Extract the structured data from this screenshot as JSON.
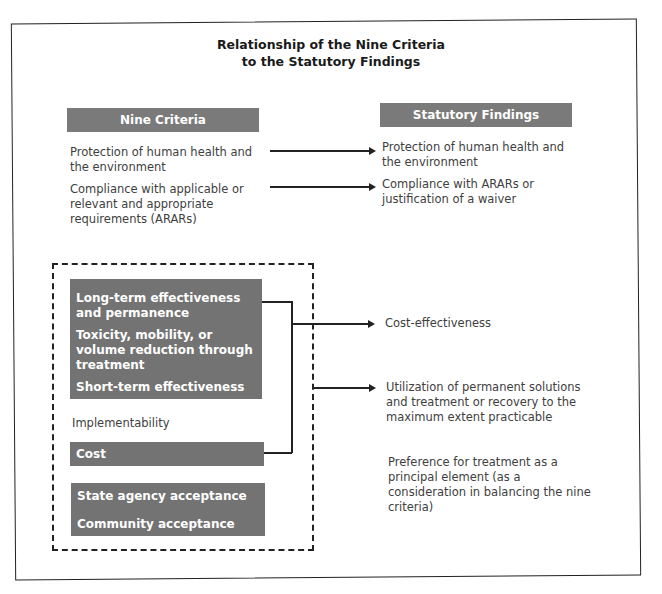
{
  "title": {
    "line1": "Relationship of the Nine Criteria",
    "line2": "to the Statutory Findings"
  },
  "left_header": "Nine Criteria",
  "right_header": "Statutory Findings",
  "criteria_threshold": [
    {
      "text": "Protection of human health and the environment"
    },
    {
      "text": "Compliance with applicable or relevant and appropriate requirements (ARARs)"
    }
  ],
  "findings_threshold": [
    {
      "text": "Protection of human health and the environment"
    },
    {
      "text": "Compliance with ARARs or justification of a waiver"
    }
  ],
  "balancing_group": [
    {
      "text": "Long-term effectiveness and permanence"
    },
    {
      "text": "Toxicity, mobility, or volume reduction through treatment"
    },
    {
      "text": "Short-term effectiveness"
    }
  ],
  "implementability": "Implementability",
  "cost": "Cost",
  "modifying_group": [
    {
      "text": "State agency acceptance"
    },
    {
      "text": "Community acceptance"
    }
  ],
  "findings_balancing": [
    {
      "text": "Cost-effectiveness"
    },
    {
      "text": "Utilization of permanent solutions and treatment or recovery to the maximum extent practicable"
    },
    {
      "text": "Preference for treatment as a principal element (as a consideration in balancing the nine criteria)"
    }
  ],
  "colors": {
    "header_gray": "#7a7a7a",
    "box_gray": "#737373",
    "line": "#222222"
  }
}
